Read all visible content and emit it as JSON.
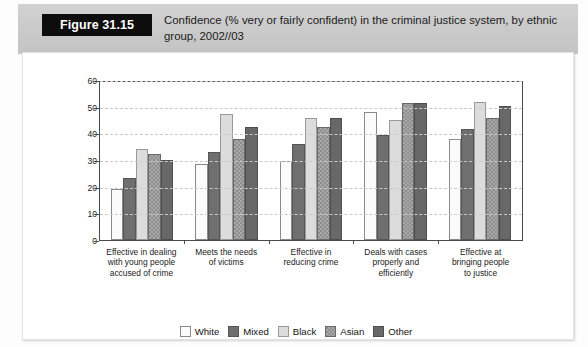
{
  "figure": {
    "badge_label": "Figure 31.15",
    "title": "Confidence (% very or fairly confident) in the criminal justice system, by ethnic group, 2002//03"
  },
  "chart_data": {
    "type": "bar",
    "title": "Confidence (% very or fairly confident) in the criminal justice system, by ethnic group, 2002//03",
    "xlabel": "",
    "ylabel": "",
    "ylim": [
      0,
      60
    ],
    "yticks": [
      0,
      10,
      20,
      30,
      40,
      50,
      60
    ],
    "grid": true,
    "legend_position": "bottom",
    "categories": [
      "Effective in dealing with young people accused of crime",
      "Meets the needs of victims",
      "Effective in reducing crime",
      "Deals with cases properly and efficiently",
      "Effective at bringing people to justice"
    ],
    "category_lines": [
      [
        "Effective in dealing",
        "with young people",
        "accused of crime"
      ],
      [
        "Meets the needs",
        "of victims"
      ],
      [
        "Effective in",
        "reducing crime"
      ],
      [
        "Deals with cases",
        "properly and",
        "efficiently"
      ],
      [
        "Effective at",
        "bringing people",
        "to justice"
      ]
    ],
    "series": [
      {
        "name": "White",
        "color": "#fbfbfb",
        "values": [
          19.5,
          29,
          30,
          48.5,
          38.5
        ]
      },
      {
        "name": "Mixed",
        "color": "#6f6f6f",
        "values": [
          23.5,
          33.5,
          36.5,
          40,
          42
        ]
      },
      {
        "name": "Black",
        "color": "#dcdcdc",
        "values": [
          34.5,
          48,
          46.5,
          45.5,
          52.5
        ]
      },
      {
        "name": "Asian",
        "color": "#8f8f8f",
        "values": [
          32.5,
          38.5,
          43,
          52,
          46.5
        ]
      },
      {
        "name": "Other",
        "color": "#686868",
        "values": [
          30.5,
          43,
          46.5,
          52,
          51
        ]
      }
    ]
  }
}
